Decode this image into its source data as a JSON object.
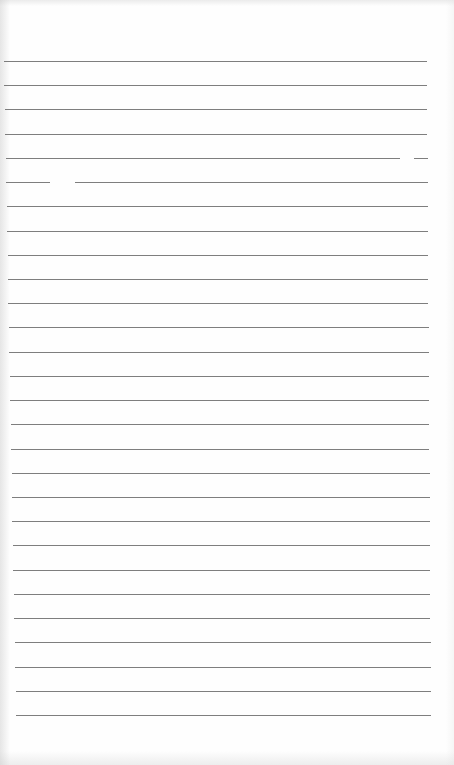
{
  "document": {
    "kind": "blank lined notebook page",
    "ruled_line_count": 28,
    "line_color": "#707070",
    "paper_color": "#fefefe",
    "text": ""
  }
}
